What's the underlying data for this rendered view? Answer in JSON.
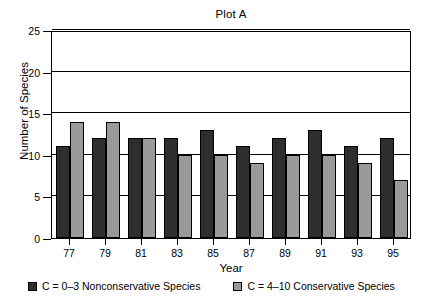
{
  "chart_data": {
    "type": "bar",
    "title": "Plot A",
    "xlabel": "Year",
    "ylabel": "Number of Species",
    "categories": [
      "77",
      "79",
      "81",
      "83",
      "85",
      "87",
      "89",
      "91",
      "93",
      "95"
    ],
    "series": [
      {
        "name": "C = 0–3 Nonconservative Species",
        "color": "#2e2e2e",
        "values": [
          11,
          12,
          12,
          12,
          13,
          11,
          12,
          13,
          11,
          12
        ]
      },
      {
        "name": "C = 4–10 Conservative Species",
        "color": "#9a9a9a",
        "values": [
          14,
          14,
          12,
          10,
          10,
          9,
          10,
          10,
          9,
          7
        ]
      }
    ],
    "ylim": [
      0,
      25
    ],
    "yticks": [
      0,
      5,
      10,
      15,
      20,
      25
    ],
    "grid": true,
    "gridlines_y": [
      5,
      10,
      15,
      20,
      25
    ],
    "legend_position": "bottom"
  },
  "legend": {
    "items": [
      {
        "label": "C = 0–3 Nonconservative Species",
        "swatch": "dark"
      },
      {
        "label": "C = 4–10 Conservative Species",
        "swatch": "light"
      }
    ]
  }
}
